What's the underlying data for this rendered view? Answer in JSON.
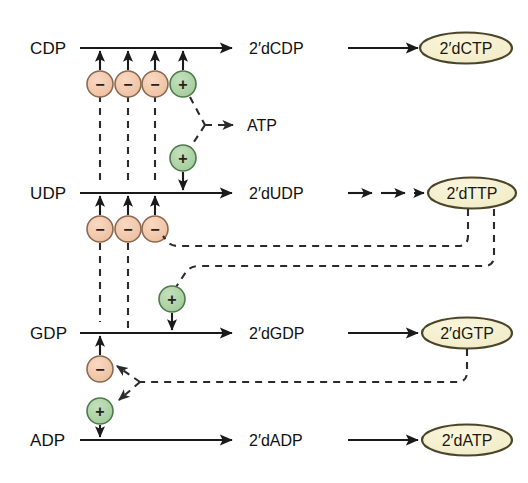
{
  "diagram": {
    "colors": {
      "negative_circle_fill": "#f0c4a6",
      "positive_circle_fill": "#a9cfa2",
      "oval_fill": "#f4efcd",
      "oval_stroke": "#4a4428",
      "line": "#1a1a1a",
      "background": "#ffffff"
    },
    "rows": [
      {
        "id": "cdp-row",
        "substrate": "CDP",
        "intermediate": "2′dCDP",
        "product": "2′dCTP",
        "arrow_count": 1
      },
      {
        "id": "udp-row",
        "substrate": "UDP",
        "intermediate": "2′dUDP",
        "product": "2′dTTP",
        "arrow_count": 3
      },
      {
        "id": "gdp-row",
        "substrate": "GDP",
        "intermediate": "2′dGDP",
        "product": "2′dGTP",
        "arrow_count": 1
      },
      {
        "id": "adp-row",
        "substrate": "ADP",
        "intermediate": "2′dADP",
        "product": "2′dATP",
        "arrow_count": 1
      }
    ],
    "effectors": {
      "atp_label": "ATP",
      "negative_sign": "−",
      "positive_sign": "+"
    },
    "regulator_circles": [
      {
        "id": "cdp-neg-1",
        "sign": "−",
        "type": "negative"
      },
      {
        "id": "cdp-neg-2",
        "sign": "−",
        "type": "negative"
      },
      {
        "id": "cdp-neg-3",
        "sign": "−",
        "type": "negative"
      },
      {
        "id": "cdp-pos-atp",
        "sign": "+",
        "type": "positive"
      },
      {
        "id": "udp-pos-atp",
        "sign": "+",
        "type": "positive"
      },
      {
        "id": "udp-neg-1",
        "sign": "−",
        "type": "negative"
      },
      {
        "id": "udp-neg-2",
        "sign": "−",
        "type": "negative"
      },
      {
        "id": "udp-neg-3",
        "sign": "−",
        "type": "negative"
      },
      {
        "id": "gdp-pos",
        "sign": "+",
        "type": "positive"
      },
      {
        "id": "gdp-neg",
        "sign": "−",
        "type": "negative"
      },
      {
        "id": "adp-pos",
        "sign": "+",
        "type": "positive"
      }
    ]
  }
}
